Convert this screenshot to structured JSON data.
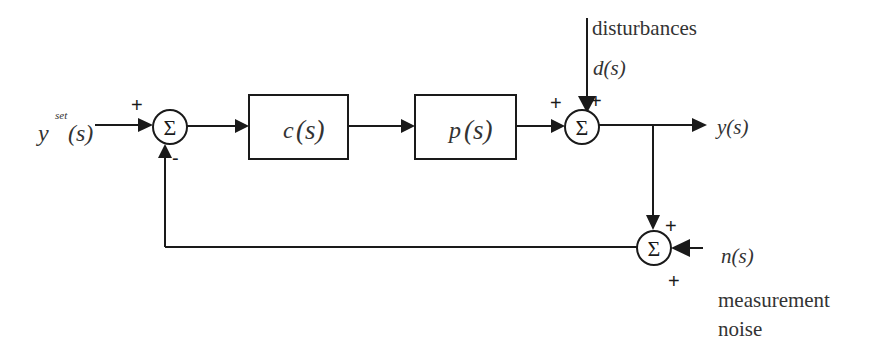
{
  "diagram": {
    "type": "feedback-control-block-diagram",
    "colors": {
      "stroke": "#1a1a1a",
      "text": "#333333",
      "background": "#ffffff"
    },
    "input": {
      "base": "y",
      "superscript": "set",
      "arg": "(s)"
    },
    "blocks": [
      {
        "id": "controller",
        "fn": "c",
        "arg": "(s)"
      },
      {
        "id": "plant",
        "fn": "p",
        "arg": "(s)"
      }
    ],
    "summing_junctions": [
      {
        "id": "sum1",
        "symbol": "Σ",
        "signs": [
          "+",
          "-"
        ]
      },
      {
        "id": "sum2",
        "symbol": "Σ",
        "signs": [
          "+",
          "+"
        ]
      },
      {
        "id": "sum3",
        "symbol": "Σ",
        "signs": [
          "+",
          "+"
        ]
      }
    ],
    "output": {
      "label": "y(s)"
    },
    "disturbance": {
      "caption": "disturbances",
      "label": "d(s)"
    },
    "noise": {
      "label": "n(s)",
      "caption_line1": "measurement",
      "caption_line2": "noise"
    }
  }
}
